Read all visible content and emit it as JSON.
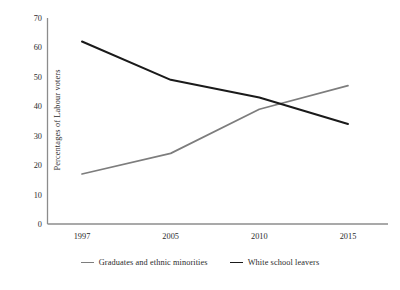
{
  "chart_data": {
    "type": "line",
    "title": "",
    "subtitle": "",
    "xlabel": "",
    "ylabel": "Percentages of Labour voters",
    "x": [
      1997,
      2005,
      2010,
      2015
    ],
    "categories": [
      "1997",
      "2005",
      "2010",
      "2015"
    ],
    "xtick_labels": [
      "1997",
      "2005",
      "2010",
      "2015"
    ],
    "ytick_labels": [
      "0",
      "10",
      "20",
      "30",
      "40",
      "50",
      "60",
      "70"
    ],
    "yticks": [
      0,
      10,
      20,
      30,
      40,
      50,
      60,
      70
    ],
    "ylim": [
      0,
      70
    ],
    "xlim": [
      1995.5,
      2016.5
    ],
    "grid": false,
    "legend_position": "bottom",
    "series": [
      {
        "name": "Graduates and ethnic minorities",
        "color": "#7d7d7d",
        "values": [
          17,
          24,
          39,
          47
        ]
      },
      {
        "name": "White school leavers",
        "color": "#1a1a1a",
        "values": [
          62,
          49,
          43,
          34
        ]
      }
    ]
  },
  "legend": {
    "entries": [
      {
        "label": "Graduates and ethnic minorities",
        "color": "#7d7d7d"
      },
      {
        "label": "White school leavers",
        "color": "#1a1a1a"
      }
    ]
  },
  "axes": {
    "y_title": "Percentages of Labour voters",
    "axis_color": "#8c8c8c"
  }
}
